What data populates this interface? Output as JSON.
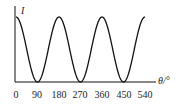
{
  "chart_data": {
    "type": "line",
    "title": "",
    "xlabel": "θ/°",
    "ylabel": "I",
    "x_ticks": [
      "0",
      "90",
      "180",
      "270",
      "360",
      "450",
      "540"
    ],
    "x": [
      0,
      90,
      180,
      270,
      360,
      450,
      540
    ],
    "series": [
      {
        "name": "I",
        "values": [
          1,
          0,
          1,
          0,
          1,
          0,
          1
        ]
      }
    ],
    "function": "I ∝ cos²(θ)",
    "xlim": [
      0,
      540
    ],
    "grid": false,
    "legend": "none"
  },
  "axis": {
    "y_label": "I",
    "x_label": "θ/°",
    "ticks": [
      "0",
      "90",
      "180",
      "270",
      "360",
      "450",
      "540"
    ]
  }
}
